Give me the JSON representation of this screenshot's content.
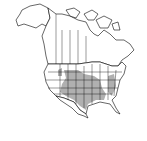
{
  "map": {
    "type": "range-map",
    "region": "North America",
    "colors": {
      "land": "#ffffff",
      "range": "#b0b0b0",
      "border": "#000000"
    },
    "shaded_region_desc": "Central and southern United States"
  }
}
